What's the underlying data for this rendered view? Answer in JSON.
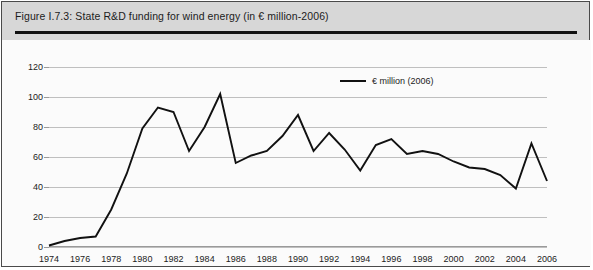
{
  "figure": {
    "title": "Figure I.7.3: State R&D funding for wind energy (in € million-2006)",
    "title_band_color": "#d7d7d7",
    "plot_background": "#fbfbfb",
    "border_color": "#4a4a4a"
  },
  "legend": {
    "position": "top-right-inside",
    "entries": [
      {
        "label": "€ million (2006)",
        "color": "#111111",
        "marker": "line"
      }
    ]
  },
  "chart_data": {
    "type": "line",
    "title": "Figure I.7.3: State R&D funding for wind energy (in € million-2006)",
    "xlabel": "",
    "ylabel": "",
    "xlim": [
      1974,
      2006
    ],
    "ylim": [
      0,
      120
    ],
    "grid": true,
    "ytick_labels": [
      "0",
      "20",
      "40",
      "60",
      "80",
      "100",
      "120"
    ],
    "ytick_values": [
      0,
      20,
      40,
      60,
      80,
      100,
      120
    ],
    "xtick_labels": [
      "1974",
      "1976",
      "1978",
      "1980",
      "1982",
      "1984",
      "1986",
      "1988",
      "1990",
      "1992",
      "1994",
      "1996",
      "1998",
      "2000",
      "2002",
      "2004",
      "2006"
    ],
    "xtick_values": [
      1974,
      1976,
      1978,
      1980,
      1982,
      1984,
      1986,
      1988,
      1990,
      1992,
      1994,
      1996,
      1998,
      2000,
      2002,
      2004,
      2006
    ],
    "line_color": "#111111",
    "x": [
      1974,
      1975,
      1976,
      1977,
      1978,
      1979,
      1980,
      1981,
      1982,
      1983,
      1984,
      1985,
      1986,
      1987,
      1988,
      1989,
      1990,
      1991,
      1992,
      1993,
      1994,
      1995,
      1996,
      1997,
      1998,
      1999,
      2000,
      2001,
      2002,
      2003,
      2004,
      2005,
      2006
    ],
    "series": [
      {
        "name": "€ million (2006)",
        "values": [
          1,
          4,
          6,
          7,
          25,
          49,
          79,
          93,
          90,
          64,
          80,
          102,
          56,
          61,
          64,
          74,
          88,
          64,
          76,
          65,
          51,
          68,
          72,
          62,
          64,
          62,
          57,
          53,
          52,
          48,
          39,
          69,
          44
        ]
      }
    ]
  }
}
